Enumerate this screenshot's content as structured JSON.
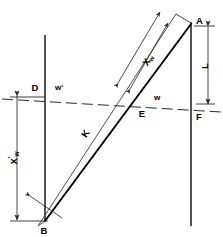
{
  "figure": {
    "type": "geometric-diagram",
    "background_color": "#ffffff",
    "stroke_color": "#000000",
    "width": 223,
    "height": 237
  },
  "labels": {
    "point_a": "A",
    "point_b": "B",
    "point_d": "D",
    "point_e": "E",
    "point_f": "F",
    "segment_k": "K",
    "segment_l": "L",
    "angle_w": "w",
    "angle_w_prime": "w'",
    "dim_xw_base": "X",
    "dim_xw_sub": "w",
    "dim_xw_prime_base": "X",
    "dim_xw_prime_prime": "'",
    "dim_xw_prime_sub": "w"
  },
  "geometry": {
    "left_vertical": {
      "x": 45,
      "y_top": 35,
      "y_bottom": 222
    },
    "right_vertical": {
      "x": 191,
      "y_top": 22,
      "y_bottom": 226
    },
    "main_diagonal": {
      "x1": 45,
      "y1": 221,
      "x2": 191,
      "y2": 24
    },
    "thin_diagonal": {
      "x1": 38,
      "y1": 226,
      "x2": 176,
      "y2": 14
    },
    "dashed_line": {
      "x1": 2,
      "y1": 99,
      "x2": 221,
      "y2": 112
    },
    "point_e_xy": {
      "x": 140,
      "y": 103
    },
    "point_d_xy": {
      "x": 45,
      "y": 97
    }
  },
  "dimensions": {
    "xw_prime_axis_x": 17,
    "xw_prime_top_y": 96,
    "xw_prime_bottom_y": 220,
    "l_axis_x": 208,
    "l_top_y": 26,
    "l_bottom_y": 104
  }
}
